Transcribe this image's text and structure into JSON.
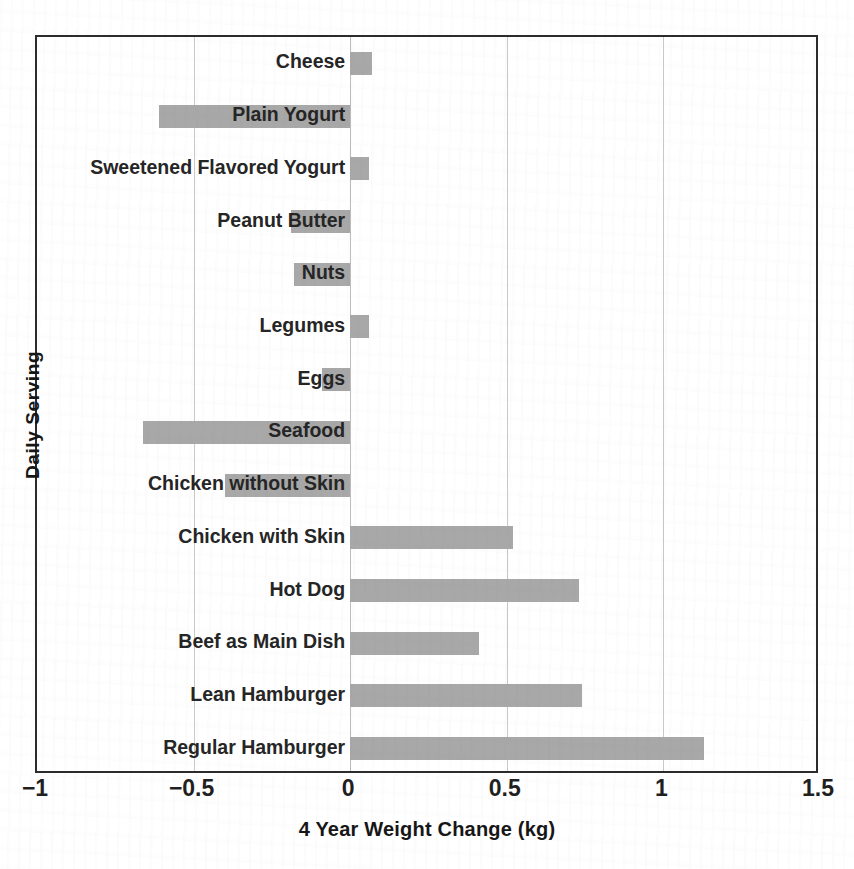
{
  "chart_data": {
    "type": "bar",
    "orientation": "horizontal",
    "title": "",
    "xlabel": "4 Year Weight Change (kg)",
    "ylabel": "Daily Serving",
    "xlim": [
      -1,
      1.5
    ],
    "xticks": [
      -1,
      -0.5,
      0,
      0.5,
      1,
      1.5
    ],
    "xtick_labels": [
      "−1",
      "−0.5",
      "0",
      "0.5",
      "1",
      "1.5"
    ],
    "grid": true,
    "grid_axis": "x",
    "legend": false,
    "bar_color": "#a8a8a8",
    "categories": [
      "Cheese",
      "Plain Yogurt",
      "Sweetened Flavored Yogurt",
      "Peanut Butter",
      "Nuts",
      "Legumes",
      "Eggs",
      "Seafood",
      "Chicken without Skin",
      "Chicken with Skin",
      "Hot Dog",
      "Beef as Main Dish",
      "Lean Hamburger",
      "Regular Hamburger"
    ],
    "values": [
      0.07,
      -0.61,
      0.06,
      -0.19,
      -0.18,
      0.06,
      -0.09,
      -0.66,
      -0.4,
      0.52,
      0.73,
      0.41,
      0.74,
      1.13
    ]
  }
}
